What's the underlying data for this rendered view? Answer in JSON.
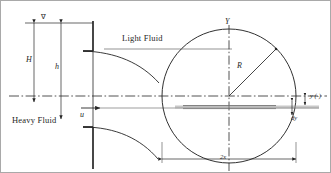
{
  "figure": {
    "domain": "diagram",
    "type": "engineering-schematic",
    "background_color": "#ffffff",
    "line_color": "#262626",
    "strip_color": "#9a9a9a",
    "border_color": "#a9a9a9"
  },
  "labels": {
    "free_surface_symbol": "∇",
    "height_total": "H",
    "height_inner": "h",
    "velocity": "u",
    "light_fluid": "Light Fluid",
    "heavy_fluid": "Heavy Fluid",
    "axis_vertical": "Y",
    "radius": "R",
    "strip_offset": "y (-)",
    "strip_thickness": "dy",
    "width_span": "2x"
  },
  "geometry": {
    "circle_center_x": 228,
    "circle_center_y": 95,
    "circle_radius": 67,
    "centerline_y": 95,
    "strip_y": 106,
    "strip_height": 3,
    "wall_x": 92,
    "dim_H_x": 33,
    "dim_h_x": 60,
    "top_y": 22,
    "span_dim_y": 158
  }
}
